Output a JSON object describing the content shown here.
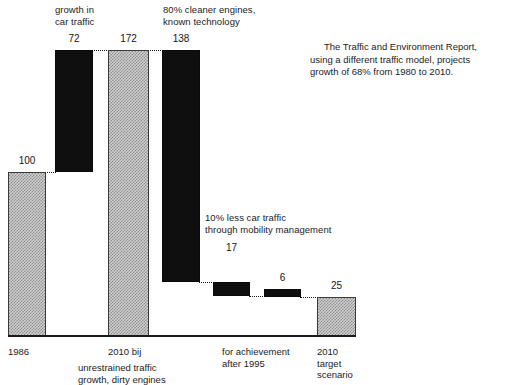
{
  "chart_data": {
    "type": "bar",
    "subtype": "waterfall",
    "title": "",
    "xlabel": "",
    "ylabel": "",
    "ylim": [
      0,
      172
    ],
    "grid": false,
    "legend": "none",
    "categories": [
      "1986",
      "growth in car traffic",
      "2010 bij unrestrained traffic growth, dirty engines",
      "80% cleaner engines, known technology",
      "10% less car traffic through mobility management",
      "for achievement after 1995",
      "2010 target scenario"
    ],
    "values": [
      100,
      72,
      172,
      138,
      17,
      6,
      25
    ],
    "bar_roles": [
      "total",
      "increase",
      "total",
      "decrease",
      "decrease",
      "decrease",
      "total"
    ],
    "cumulative_top": [
      100,
      172,
      172,
      34,
      17,
      11,
      25
    ],
    "cumulative_bottom": [
      0,
      100,
      0,
      -104,
      -17,
      -6,
      0
    ],
    "bar_fills": [
      "hatched-gray",
      "black",
      "hatched-gray",
      "black",
      "black",
      "black",
      "hatched-gray"
    ],
    "annotations": [
      "growth in\ncar traffic",
      "80% cleaner engines,\nknown technology",
      "10% less car traffic\nthrough mobility management",
      "The Traffic and Environment Report, using a different traffic model, projects growth of 68% from 1980 to 2010."
    ],
    "tick_labels": [
      "1986",
      "2010 bij",
      "for achievement",
      "2010"
    ]
  },
  "bars": [
    {
      "value": "100",
      "fill": "hatch",
      "x": 8,
      "w": 38,
      "top": 172,
      "bottom": 336,
      "label_x": 8,
      "label_w": 38,
      "label_y": 155
    },
    {
      "value": "72",
      "fill": "dark",
      "x": 55,
      "w": 38,
      "top": 50,
      "bottom": 172,
      "label_x": 55,
      "label_w": 38,
      "label_y": 33
    },
    {
      "value": "172",
      "fill": "hatch",
      "x": 108,
      "w": 41,
      "top": 50,
      "bottom": 336,
      "label_x": 108,
      "label_w": 41,
      "label_y": 33
    },
    {
      "value": "138",
      "fill": "dark",
      "x": 162,
      "w": 38,
      "top": 50,
      "bottom": 282,
      "label_x": 162,
      "label_w": 38,
      "label_y": 33
    },
    {
      "value": "17",
      "fill": "dark",
      "x": 213,
      "w": 37,
      "top": 282,
      "bottom": 296,
      "label_x": 213,
      "label_w": 37,
      "label_y": 242
    },
    {
      "value": "6",
      "fill": "dark",
      "x": 264,
      "w": 37,
      "top": 289,
      "bottom": 297,
      "label_x": 264,
      "label_w": 37,
      "label_y": 272
    },
    {
      "value": "25",
      "fill": "hatch",
      "x": 317,
      "w": 39,
      "top": 297,
      "bottom": 336,
      "label_x": 317,
      "label_w": 39,
      "label_y": 280
    }
  ],
  "connectors": [
    {
      "x": 45,
      "y": 172,
      "w": 11
    },
    {
      "x": 92,
      "y": 50,
      "w": 17
    },
    {
      "x": 148,
      "y": 50,
      "w": 15
    },
    {
      "x": 199,
      "y": 282,
      "w": 15
    },
    {
      "x": 249,
      "y": 296,
      "w": 16
    },
    {
      "x": 300,
      "y": 297,
      "w": 18
    }
  ],
  "annotations": {
    "growth_in_car_traffic": "growth in\ncar traffic",
    "cleaner_engines": "80% cleaner engines,\nknown technology",
    "mobility_management": "10% less car traffic\nthrough mobility management",
    "report_note": "The Traffic and Environment Report, using a different traffic model, projects growth of 68% from 1980 to 2010."
  },
  "axis_labels": {
    "cat_1986": "1986",
    "cat_2010_bij": "2010 bij",
    "cat_2010_bij_sub": "unrestrained traffic\ngrowth, dirty engines",
    "cat_for_achievement": "for achievement\nafter 1995",
    "cat_2010_target": "2010\ntarget\nscenario"
  },
  "colors": {
    "bar_dark": "#100f0f",
    "bar_hatch_gray": "#cfcfcf",
    "bar_hatch_line": "#8e8e8e",
    "outline": "#3a3a3a",
    "text": "#1c1c1c",
    "background": "#ffffff"
  }
}
